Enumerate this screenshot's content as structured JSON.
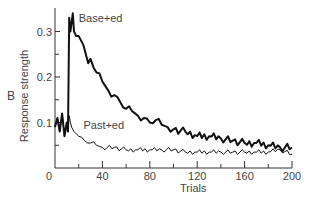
{
  "chart_data": {
    "type": "line",
    "title": "",
    "panel_label": "B",
    "xlabel": "Trials",
    "ylabel": "Response strength",
    "xlim": [
      0,
      200
    ],
    "ylim": [
      0,
      0.35
    ],
    "x_ticks": [
      0,
      40,
      80,
      120,
      160,
      200
    ],
    "x_minor_ticks": [
      20,
      60,
      100,
      140,
      180
    ],
    "y_ticks": [
      0.1,
      0.2,
      0.3
    ],
    "y_tick_labels": [
      "0.1",
      "0.2",
      "0.3"
    ],
    "y_minor_ticks": [
      0.05,
      0.15,
      0.25
    ],
    "origin_label": "0",
    "grid": false,
    "legend_position": "inline labels",
    "series": [
      {
        "name": "Base+ed",
        "stroke_width": 2,
        "label_position": {
          "trial": 20,
          "value": 0.32
        },
        "x": [
          0,
          2,
          4,
          6,
          8,
          10,
          11,
          12,
          13,
          14,
          15,
          16,
          18,
          20,
          22,
          24,
          26,
          28,
          30,
          35,
          40,
          45,
          50,
          55,
          60,
          65,
          70,
          75,
          80,
          85,
          90,
          95,
          100,
          110,
          120,
          130,
          140,
          150,
          160,
          170,
          180,
          190,
          200
        ],
        "values": [
          0.09,
          0.11,
          0.08,
          0.12,
          0.07,
          0.1,
          0.08,
          0.33,
          0.3,
          0.32,
          0.34,
          0.3,
          0.29,
          0.29,
          0.28,
          0.27,
          0.25,
          0.23,
          0.24,
          0.21,
          0.19,
          0.17,
          0.16,
          0.145,
          0.13,
          0.125,
          0.115,
          0.11,
          0.1,
          0.105,
          0.095,
          0.09,
          0.085,
          0.08,
          0.07,
          0.07,
          0.065,
          0.06,
          0.055,
          0.055,
          0.05,
          0.045,
          0.045
        ]
      },
      {
        "name": "Past+ed",
        "stroke_width": 1,
        "label_position": {
          "trial": 24,
          "value": 0.085
        },
        "x": [
          0,
          2,
          4,
          6,
          8,
          10,
          11,
          12,
          13,
          14,
          16,
          18,
          20,
          25,
          30,
          35,
          40,
          50,
          60,
          70,
          80,
          90,
          100,
          110,
          120,
          130,
          140,
          150,
          160,
          170,
          180,
          190,
          200
        ],
        "values": [
          0.09,
          0.11,
          0.08,
          0.12,
          0.07,
          0.1,
          0.08,
          0.115,
          0.1,
          0.09,
          0.08,
          0.075,
          0.07,
          0.06,
          0.055,
          0.05,
          0.045,
          0.045,
          0.04,
          0.04,
          0.04,
          0.04,
          0.04,
          0.035,
          0.035,
          0.035,
          0.035,
          0.035,
          0.035,
          0.035,
          0.035,
          0.04,
          0.03
        ]
      }
    ]
  }
}
